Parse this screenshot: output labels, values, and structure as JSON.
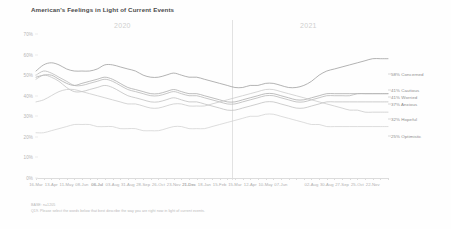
{
  "chart_data": {
    "type": "line",
    "title": "American's Feelings in Light of Current Events",
    "xlabel": "",
    "ylabel": "",
    "ylim": [
      0,
      70
    ],
    "grid": false,
    "legend_position": "right",
    "y_ticks": [
      "0%",
      "10%",
      "20%",
      "30%",
      "40%",
      "50%",
      "60%",
      "70%"
    ],
    "year_bands": [
      {
        "label": "2020"
      },
      {
        "label": "2021"
      }
    ],
    "x": [
      "16-Mar",
      "30-Mar",
      "13-Apr",
      "27-Apr",
      "11-May",
      "25-May",
      "08-Jun",
      "22-Jun",
      "06-Jul",
      "20-Jul",
      "03-Aug",
      "17-Aug",
      "31-Aug",
      "14-Sep",
      "28-Sep",
      "12-Oct",
      "26-Oct",
      "09-Nov",
      "23-Nov",
      "07-Dec",
      "21-Dec",
      "04-Jan",
      "18-Jan",
      "01-Feb",
      "15-Feb",
      "01-Mar",
      "15-Mar",
      "29-Mar",
      "12-Apr",
      "26-Apr",
      "10-May",
      "24-May",
      "07-Jun",
      "21-Jun",
      "06-Jul",
      "19-Jul",
      "02-Aug",
      "16-Aug",
      "30-Aug",
      "13-Sep",
      "27-Sep",
      "11-Oct",
      "25-Oct",
      "08-Nov",
      "22-Nov",
      "06-Dec",
      "21-Dec"
    ],
    "x_tick_labels": [
      "16-Mar",
      "13-Apr",
      "11-May",
      "08-Jun",
      "06-Jul",
      "03-Aug",
      "31-Aug",
      "28-Sep",
      "26-Oct",
      "23-Nov",
      "21-Dec",
      "18-Jan",
      "15-Feb",
      "15-Mar",
      "12-Apr",
      "10-May",
      "07-Jun",
      "06-Jul",
      "02-Aug",
      "30-Aug",
      "27-Sep",
      "25-Oct",
      "22-Nov",
      "21-Dec"
    ],
    "series": [
      {
        "name": "Concerned",
        "end_label": "58% Concerned",
        "end_value": 58,
        "color": "#9a9a9a",
        "values": [
          52,
          55,
          56,
          55,
          53,
          52,
          52,
          52,
          53,
          55,
          55,
          54,
          53,
          52,
          50,
          49,
          49,
          50,
          51,
          50,
          49,
          49,
          48,
          47,
          46,
          45,
          44,
          44,
          45,
          45,
          46,
          46,
          45,
          44,
          44,
          45,
          47,
          50,
          52,
          53,
          54,
          55,
          56,
          57,
          58,
          58,
          58
        ]
      },
      {
        "name": "Cautious",
        "end_label": "41% Cautious",
        "end_value": 41,
        "color": "#a8a8a8",
        "values": [
          49,
          50,
          50,
          48,
          46,
          45,
          46,
          47,
          48,
          49,
          48,
          46,
          44,
          43,
          42,
          41,
          41,
          42,
          43,
          42,
          41,
          41,
          40,
          39,
          38,
          37,
          37,
          38,
          39,
          40,
          41,
          41,
          40,
          39,
          38,
          38,
          39,
          40,
          41,
          41,
          41,
          41,
          41,
          41,
          41,
          41,
          41
        ]
      },
      {
        "name": "Worried",
        "end_label": "41% Worried",
        "end_value": 41,
        "color": "#b4b4b4",
        "values": [
          50,
          52,
          51,
          49,
          47,
          45,
          45,
          46,
          47,
          48,
          47,
          45,
          43,
          42,
          41,
          40,
          40,
          41,
          42,
          41,
          40,
          40,
          39,
          38,
          37,
          36,
          36,
          37,
          38,
          39,
          40,
          40,
          39,
          38,
          37,
          37,
          38,
          39,
          40,
          40,
          40,
          40,
          41,
          41,
          41,
          41,
          41
        ]
      },
      {
        "name": "Anxious",
        "end_label": "37% Anxious",
        "end_value": 37,
        "color": "#bdbdbd",
        "values": [
          48,
          50,
          49,
          47,
          44,
          42,
          42,
          43,
          44,
          45,
          44,
          42,
          40,
          39,
          38,
          37,
          37,
          38,
          39,
          38,
          37,
          37,
          36,
          35,
          34,
          33,
          33,
          34,
          35,
          36,
          37,
          37,
          36,
          35,
          34,
          34,
          35,
          36,
          37,
          37,
          37,
          37,
          37,
          37,
          37,
          37,
          37
        ]
      },
      {
        "name": "Hopeful",
        "end_label": "32% Hopeful",
        "end_value": 32,
        "color": "#c8c8c8",
        "values": [
          37,
          38,
          40,
          42,
          43,
          43,
          42,
          41,
          40,
          39,
          38,
          37,
          36,
          36,
          35,
          34,
          34,
          35,
          36,
          36,
          35,
          35,
          35,
          36,
          37,
          38,
          39,
          40,
          41,
          42,
          43,
          43,
          42,
          41,
          40,
          39,
          38,
          37,
          36,
          35,
          34,
          33,
          33,
          32,
          32,
          32,
          32
        ]
      },
      {
        "name": "Optimistic",
        "end_label": "25% Optimistic",
        "end_value": 25,
        "color": "#d2d2d2",
        "values": [
          22,
          22,
          23,
          24,
          25,
          26,
          26,
          26,
          25,
          25,
          25,
          24,
          24,
          24,
          23,
          23,
          23,
          24,
          25,
          25,
          24,
          24,
          24,
          25,
          26,
          27,
          28,
          29,
          30,
          30,
          31,
          31,
          30,
          29,
          28,
          27,
          26,
          26,
          25,
          25,
          25,
          25,
          25,
          25,
          25,
          25,
          25
        ]
      }
    ]
  },
  "footnotes": {
    "base": "BASE: n=1205",
    "question": "Q19. Please select the words below that best describe the way you are right now in light of current events."
  }
}
